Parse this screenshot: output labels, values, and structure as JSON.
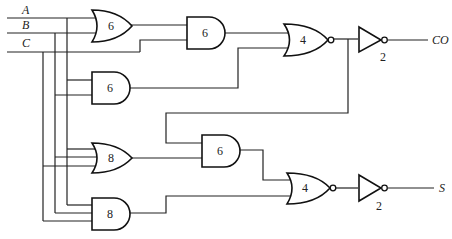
{
  "diagram": {
    "type": "logic-circuit",
    "inputs": [
      {
        "id": "A",
        "label": "A"
      },
      {
        "id": "B",
        "label": "B"
      },
      {
        "id": "C",
        "label": "C"
      }
    ],
    "outputs": [
      {
        "id": "CO",
        "label": "CO"
      },
      {
        "id": "S",
        "label": "S"
      }
    ],
    "gates": [
      {
        "id": "or1",
        "type": "OR",
        "label": "6"
      },
      {
        "id": "and1",
        "type": "AND",
        "label": "6"
      },
      {
        "id": "nor1",
        "type": "NOR",
        "label": "4"
      },
      {
        "id": "not1",
        "type": "NOT",
        "label": "2"
      },
      {
        "id": "and2",
        "type": "AND",
        "label": "6"
      },
      {
        "id": "or2",
        "type": "OR",
        "label": "8"
      },
      {
        "id": "and3",
        "type": "AND",
        "label": "6"
      },
      {
        "id": "nor2",
        "type": "NOR",
        "label": "4"
      },
      {
        "id": "not2",
        "type": "NOT",
        "label": "2"
      },
      {
        "id": "and4",
        "type": "AND",
        "label": "8"
      }
    ]
  }
}
